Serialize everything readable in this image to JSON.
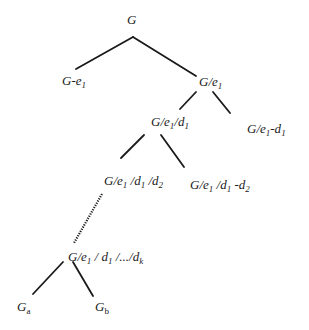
{
  "diagram": {
    "type": "tree",
    "line_color": "#1a1a1a",
    "nodes": {
      "root": {
        "label": "G"
      },
      "minus_e1": {
        "base": "G-e",
        "sub": "1"
      },
      "contract_e1": {
        "base": "G/e",
        "sub": "1"
      },
      "contract_d1": {
        "p1": "G/e",
        "s1": "1",
        "p2": "/d",
        "s2": "1"
      },
      "minus_d1": {
        "p1": "G/e",
        "s1": "1",
        "p2": "-d",
        "s2": "1"
      },
      "contract_d2": {
        "p1": "G/e",
        "s1": "1",
        "p2": " /d",
        "s2": "1",
        "p3": " /d",
        "s3": "2"
      },
      "minus_d2": {
        "p1": "G/e",
        "s1": "1",
        "p2": " /d",
        "s2": "1",
        "p3": " -d",
        "s3": "2"
      },
      "contract_dk": {
        "p1": "G/e",
        "s1": "1",
        "p2": " / d",
        "s2": "1",
        "p3": " /.../d",
        "s3": "k"
      },
      "ga": {
        "base": "G",
        "sub": "a"
      },
      "gb": {
        "base": "G",
        "sub": "b"
      }
    },
    "edges": [
      {
        "from": "root",
        "to": "minus_e1",
        "style": "solid"
      },
      {
        "from": "root",
        "to": "contract_e1",
        "style": "solid"
      },
      {
        "from": "contract_e1",
        "to": "contract_d1",
        "style": "solid"
      },
      {
        "from": "contract_e1",
        "to": "minus_d1",
        "style": "solid"
      },
      {
        "from": "contract_d1",
        "to": "contract_d2",
        "style": "solid"
      },
      {
        "from": "contract_d1",
        "to": "minus_d2",
        "style": "solid"
      },
      {
        "from": "contract_d2",
        "to": "contract_dk",
        "style": "dotted"
      },
      {
        "from": "contract_dk",
        "to": "ga",
        "style": "solid"
      },
      {
        "from": "contract_dk",
        "to": "gb",
        "style": "solid"
      }
    ]
  }
}
